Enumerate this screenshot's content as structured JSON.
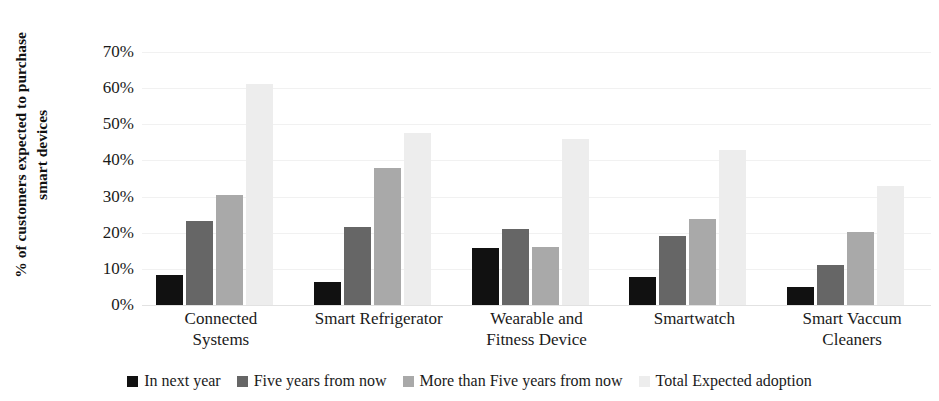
{
  "chart_data": {
    "type": "bar",
    "title": "",
    "xlabel": "",
    "ylabel": "% of customers expected to purchase smart devices",
    "ylabel_line1": "% of customers expected to purchase",
    "ylabel_line2": "smart devices",
    "ylim": [
      0,
      70
    ],
    "ytick_labels": [
      "70%",
      "60%",
      "50%",
      "40%",
      "30%",
      "20%",
      "10%",
      "0%"
    ],
    "ytick_values": [
      70,
      60,
      50,
      40,
      30,
      20,
      10,
      0
    ],
    "grid": true,
    "legend_position": "bottom",
    "categories": [
      "Connected Systems",
      "Smart Refrigerator",
      "Wearable and Fitness Device",
      "Smartwatch",
      "Smart Vaccum Cleaners"
    ],
    "category_lines": [
      [
        "Connected",
        "Systems"
      ],
      [
        "Smart Refrigerator"
      ],
      [
        "Wearable and",
        "Fitness Device"
      ],
      [
        "Smartwatch"
      ],
      [
        "Smart Vaccum",
        "Cleaners"
      ]
    ],
    "series": [
      {
        "name": "In next year",
        "color": "#111111",
        "values": [
          8.2,
          6.5,
          15.8,
          7.8,
          5.0
        ]
      },
      {
        "name": "Five years from now",
        "color": "#666666",
        "values": [
          23.2,
          21.5,
          21.0,
          19.0,
          11.0
        ]
      },
      {
        "name": "More than Five years from now",
        "color": "#a9a9a9",
        "values": [
          30.5,
          38.0,
          16.0,
          23.8,
          20.2
        ]
      },
      {
        "name": "Total Expected adoption",
        "color": "#ededed",
        "values": [
          61.2,
          47.5,
          46.0,
          43.0,
          33.0
        ]
      }
    ]
  },
  "colors": {
    "series_1": "#111111",
    "series_2": "#666666",
    "series_3": "#a9a9a9",
    "series_4": "#ededed",
    "gridline": "#f1f1f1",
    "text": "#1a1a1a",
    "background": "#ffffff"
  }
}
